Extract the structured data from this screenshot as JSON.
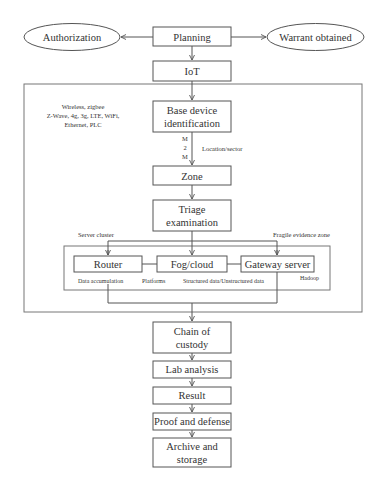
{
  "diagram": {
    "nodes": {
      "authorization": {
        "label": "Authorization",
        "shape": "ellipse"
      },
      "planning": {
        "label": "Planning",
        "shape": "rect"
      },
      "warrant": {
        "label": "Warrant obtained",
        "shape": "ellipse"
      },
      "iot": {
        "label": "IoT",
        "shape": "rect"
      },
      "base_device": {
        "label_lines": [
          "Base device",
          "identification"
        ],
        "shape": "rect"
      },
      "zone": {
        "label": "Zone",
        "shape": "rect"
      },
      "triage": {
        "label_lines": [
          "Triage",
          "examination"
        ],
        "shape": "rect"
      },
      "router": {
        "label": "Router",
        "shape": "rect"
      },
      "fog_cloud": {
        "label": "Fog/cloud",
        "shape": "rect"
      },
      "gateway": {
        "label": "Gateway server",
        "shape": "rect"
      },
      "chain": {
        "label_lines": [
          "Chain of",
          "custody"
        ],
        "shape": "rect"
      },
      "lab": {
        "label": "Lab analysis",
        "shape": "rect"
      },
      "result": {
        "label": "Result",
        "shape": "rect"
      },
      "proof": {
        "label": "Proof and defense",
        "shape": "rect"
      },
      "archive": {
        "label_lines": [
          "Archive and",
          "storage"
        ],
        "shape": "rect"
      }
    },
    "annotations": {
      "protocols": [
        "Wireless, zigbee",
        "Z-Wave, 4g, 3g, LTE, WiFi,",
        "Ethernet, PLC"
      ],
      "m2m": [
        "M",
        "2",
        "M"
      ],
      "location": "Location/sector",
      "server_cluster": "Server cluster",
      "fragile_zone": "Fragile evidence zone",
      "data_accumulation": "Data accumulation",
      "platforms": "Platforms",
      "structured": "Structured data/Unstructured data",
      "hadoop": "Hadoop"
    },
    "edges": [
      [
        "planning",
        "authorization"
      ],
      [
        "planning",
        "warrant"
      ],
      [
        "planning",
        "iot"
      ],
      [
        "iot",
        "base_device"
      ],
      [
        "base_device",
        "zone"
      ],
      [
        "zone",
        "triage"
      ],
      [
        "triage",
        "router"
      ],
      [
        "triage",
        "fog_cloud"
      ],
      [
        "triage",
        "gateway"
      ],
      [
        "router",
        "fog_cloud"
      ],
      [
        "fog_cloud",
        "gateway"
      ],
      [
        "router",
        "chain"
      ],
      [
        "gateway",
        "chain"
      ],
      [
        "chain",
        "lab"
      ],
      [
        "lab",
        "result"
      ],
      [
        "result",
        "proof"
      ],
      [
        "proof",
        "archive"
      ]
    ]
  }
}
